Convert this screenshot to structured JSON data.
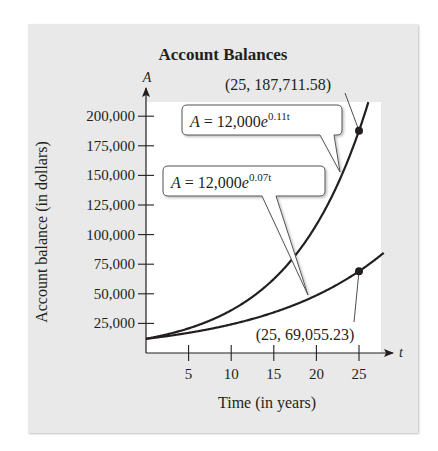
{
  "chart_data": {
    "type": "line",
    "title": "Account Balances",
    "xlabel": "Time (in years)",
    "ylabel": "Account balance (in dollars)",
    "x_axis_var": "t",
    "y_axis_var": "A",
    "xlim": [
      0,
      28
    ],
    "ylim": [
      0,
      200000
    ],
    "x_ticks": [
      5,
      10,
      15,
      20,
      25
    ],
    "y_ticks": [
      25000,
      50000,
      75000,
      100000,
      125000,
      150000,
      175000,
      200000
    ],
    "x_tick_labels": [
      "5",
      "10",
      "15",
      "20",
      "25"
    ],
    "y_tick_labels": [
      "25,000",
      "50,000",
      "75,000",
      "100,000",
      "125,000",
      "150,000",
      "175,000",
      "200,000"
    ],
    "grid": false,
    "legend": "none (curves labeled with callouts)",
    "series": [
      {
        "name": "A = 12,000e^(0.11t)",
        "principal": 12000,
        "rate": 0.11,
        "label_prefix": "A = 12,000",
        "label_base": "e",
        "label_exp": "0.11t",
        "x": [
          0,
          5,
          10,
          15,
          20,
          25
        ],
        "values": [
          12000,
          20797.2,
          36043.9,
          62468.7,
          108264.3,
          187711.58
        ]
      },
      {
        "name": "A = 12,000e^(0.07t)",
        "principal": 12000,
        "rate": 0.07,
        "label_prefix": "A = 12,000",
        "label_base": "e",
        "label_exp": "0.07t",
        "x": [
          0,
          5,
          10,
          15,
          20,
          25
        ],
        "values": [
          12000,
          17025.3,
          24165.6,
          34289.0,
          48655.2,
          69055.23
        ]
      }
    ],
    "annotations": [
      {
        "text": "(25, 187,711.58)",
        "x": 25,
        "y": 187711.58
      },
      {
        "text": "(25, 69,055.23)",
        "x": 25,
        "y": 69055.23
      }
    ]
  },
  "colors": {
    "panel_background": "#e9e9e9",
    "plot_background": "#ffffff",
    "curve": "#231f20",
    "text": "#231f20"
  }
}
